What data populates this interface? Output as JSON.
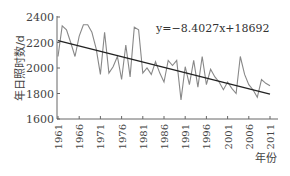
{
  "chart_data": {
    "type": "line",
    "title": "",
    "xlabel": "年份",
    "ylabel": "年日照时数/d",
    "ylim": [
      1600,
      2400
    ],
    "yticks": [
      1600,
      1800,
      2000,
      2200,
      2400
    ],
    "xlim": [
      1961,
      2012
    ],
    "xticks": [
      1961,
      1966,
      1971,
      1976,
      1981,
      1986,
      1991,
      1996,
      2001,
      2006,
      2011
    ],
    "grid": false,
    "legend": null,
    "annotations": [
      {
        "text": "y=−8.4027x+18692",
        "position": "upper-right",
        "refers_to": "trend line"
      }
    ],
    "x": [
      1961,
      1962,
      1963,
      1964,
      1965,
      1966,
      1967,
      1968,
      1969,
      1970,
      1971,
      1972,
      1973,
      1974,
      1975,
      1976,
      1977,
      1978,
      1979,
      1980,
      1981,
      1982,
      1983,
      1984,
      1985,
      1986,
      1987,
      1988,
      1989,
      1990,
      1991,
      1992,
      1993,
      1994,
      1995,
      1996,
      1997,
      1998,
      1999,
      2000,
      2001,
      2002,
      2003,
      2004,
      2005,
      2006,
      2007,
      2008,
      2009,
      2010,
      2011
    ],
    "series": [
      {
        "name": "年日照时数",
        "color": "#888888",
        "values": [
          2090,
          2330,
          2300,
          2200,
          2090,
          2250,
          2340,
          2340,
          2280,
          2150,
          1950,
          2280,
          1960,
          2010,
          2090,
          1910,
          2180,
          1930,
          2320,
          2300,
          1960,
          2000,
          1950,
          2050,
          1960,
          1890,
          2060,
          2020,
          2060,
          1750,
          2010,
          1870,
          2060,
          1850,
          2090,
          1870,
          1990,
          1930,
          1890,
          1830,
          1890,
          1840,
          1800,
          2090,
          1950,
          1870,
          1830,
          1770,
          1910,
          1880,
          1860
        ]
      },
      {
        "name": "趋势线",
        "color": "#222222",
        "equation": "y=-8.4027x+18692",
        "slope": -8.4027,
        "intercept": 18692,
        "values_at_ends": {
          "1961": 2214,
          "2011": 1794
        }
      }
    ]
  },
  "labels": {
    "ylabel": "年日照时数/d",
    "xlabel": "年份",
    "equation": "y=−8.4027x+18692"
  }
}
